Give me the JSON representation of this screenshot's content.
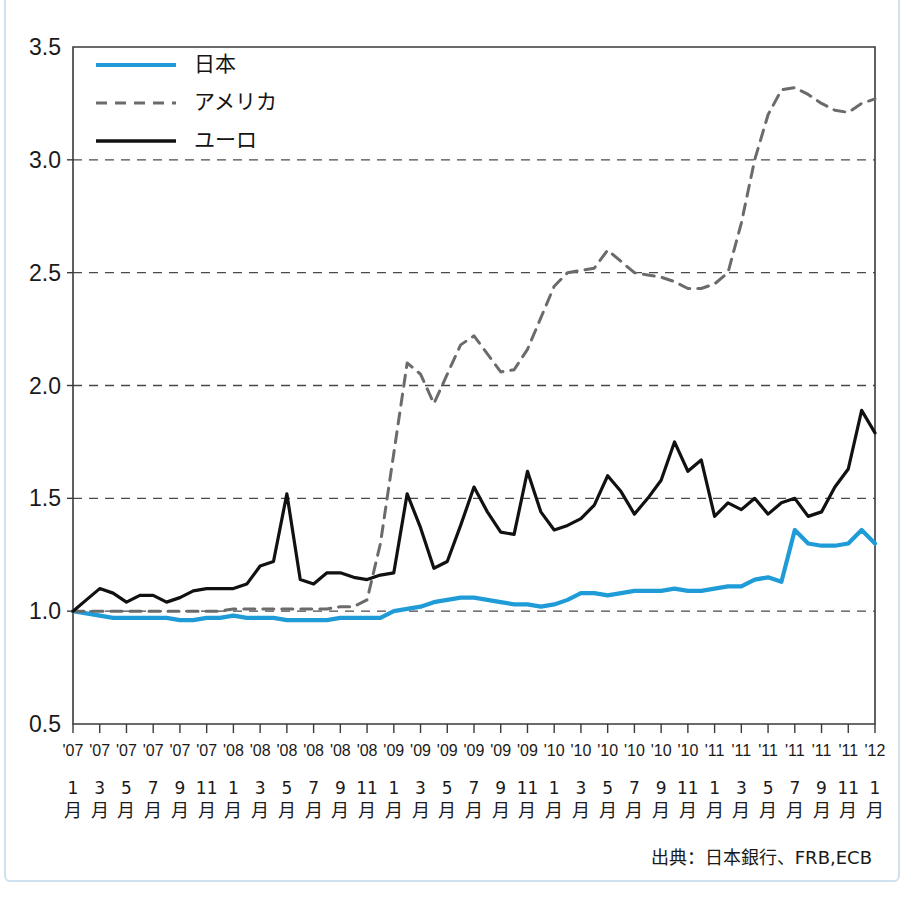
{
  "legend": {
    "position": "top-left-inside",
    "entries": [
      {
        "label": "日本",
        "style": "solid",
        "color": "#1f9cd8",
        "name": "japan"
      },
      {
        "label": "アメリカ",
        "style": "dashed",
        "color": "#6b6b6b",
        "name": "usa"
      },
      {
        "label": "ユーロ",
        "style": "solid",
        "color": "#111111",
        "name": "euro"
      }
    ]
  },
  "source": {
    "text": "出典：日本銀行、FRB,ECB"
  },
  "axis": {
    "y_ticks": [
      "3.5",
      "3.0",
      "2.5",
      "2.0",
      "1.5",
      "1.0",
      "0.5"
    ],
    "month_kanji": "月"
  },
  "chart_data": {
    "type": "line",
    "title": "",
    "xlabel": "",
    "ylabel": "",
    "ylim": [
      0.5,
      3.5
    ],
    "ytick_values": [
      0.5,
      1.0,
      1.5,
      2.0,
      2.5,
      3.0,
      3.5
    ],
    "grid": true,
    "legend_position": "top-left",
    "x_tick_labels": [
      {
        "year": "'07",
        "month": "1"
      },
      {
        "year": "'07",
        "month": "3"
      },
      {
        "year": "'07",
        "month": "5"
      },
      {
        "year": "'07",
        "month": "7"
      },
      {
        "year": "'07",
        "month": "9"
      },
      {
        "year": "'07",
        "month": "11"
      },
      {
        "year": "'08",
        "month": "1"
      },
      {
        "year": "'08",
        "month": "3"
      },
      {
        "year": "'08",
        "month": "5"
      },
      {
        "year": "'08",
        "month": "7"
      },
      {
        "year": "'08",
        "month": "9"
      },
      {
        "year": "'08",
        "month": "11"
      },
      {
        "year": "'09",
        "month": "1"
      },
      {
        "year": "'09",
        "month": "3"
      },
      {
        "year": "'09",
        "month": "5"
      },
      {
        "year": "'09",
        "month": "7"
      },
      {
        "year": "'09",
        "month": "9"
      },
      {
        "year": "'09",
        "month": "11"
      },
      {
        "year": "'10",
        "month": "1"
      },
      {
        "year": "'10",
        "month": "3"
      },
      {
        "year": "'10",
        "month": "5"
      },
      {
        "year": "'10",
        "month": "7"
      },
      {
        "year": "'10",
        "month": "9"
      },
      {
        "year": "'10",
        "month": "11"
      },
      {
        "year": "'11",
        "month": "1"
      },
      {
        "year": "'11",
        "month": "3"
      },
      {
        "year": "'11",
        "month": "5"
      },
      {
        "year": "'11",
        "month": "7"
      },
      {
        "year": "'11",
        "month": "9"
      },
      {
        "year": "'11",
        "month": "11"
      },
      {
        "year": "'12",
        "month": "1"
      }
    ],
    "x_index_range": [
      0,
      60
    ],
    "series": [
      {
        "name": "日本",
        "key": "japan",
        "color": "#1f9cd8",
        "style": "solid",
        "values": [
          1.0,
          0.99,
          0.98,
          0.97,
          0.97,
          0.97,
          0.97,
          0.97,
          0.96,
          0.96,
          0.97,
          0.97,
          0.98,
          0.97,
          0.97,
          0.97,
          0.96,
          0.96,
          0.96,
          0.96,
          0.97,
          0.97,
          0.97,
          0.97,
          1.0,
          1.01,
          1.02,
          1.04,
          1.05,
          1.06,
          1.06,
          1.05,
          1.04,
          1.03,
          1.03,
          1.02,
          1.03,
          1.05,
          1.08,
          1.08,
          1.07,
          1.08,
          1.09,
          1.09,
          1.09,
          1.1,
          1.09,
          1.09,
          1.1,
          1.11,
          1.11,
          1.14,
          1.15,
          1.13,
          1.36,
          1.3,
          1.29,
          1.29,
          1.3,
          1.36,
          1.3
        ]
      },
      {
        "name": "アメリカ",
        "key": "usa",
        "color": "#6b6b6b",
        "style": "dashed",
        "values": [
          1.0,
          1.0,
          1.0,
          1.0,
          1.0,
          1.0,
          1.0,
          1.0,
          1.0,
          1.0,
          1.0,
          1.0,
          1.01,
          1.01,
          1.01,
          1.01,
          1.01,
          1.01,
          1.01,
          1.01,
          1.02,
          1.02,
          1.05,
          1.3,
          1.7,
          2.1,
          2.05,
          1.92,
          2.05,
          2.18,
          2.22,
          2.14,
          2.06,
          2.07,
          2.16,
          2.3,
          2.44,
          2.5,
          2.51,
          2.52,
          2.6,
          2.55,
          2.5,
          2.49,
          2.48,
          2.46,
          2.43,
          2.43,
          2.45,
          2.5,
          2.72,
          3.0,
          3.2,
          3.31,
          3.32,
          3.29,
          3.25,
          3.22,
          3.21,
          3.25,
          3.27
        ]
      },
      {
        "name": "ユーロ",
        "key": "euro",
        "color": "#111111",
        "style": "solid",
        "values": [
          1.0,
          1.05,
          1.1,
          1.08,
          1.04,
          1.07,
          1.07,
          1.04,
          1.06,
          1.09,
          1.1,
          1.1,
          1.1,
          1.12,
          1.2,
          1.22,
          1.52,
          1.14,
          1.12,
          1.17,
          1.17,
          1.15,
          1.14,
          1.16,
          1.17,
          1.52,
          1.37,
          1.19,
          1.22,
          1.38,
          1.55,
          1.44,
          1.35,
          1.34,
          1.62,
          1.44,
          1.36,
          1.38,
          1.41,
          1.47,
          1.6,
          1.53,
          1.43,
          1.5,
          1.58,
          1.75,
          1.62,
          1.67,
          1.42,
          1.48,
          1.45,
          1.5,
          1.43,
          1.48,
          1.5,
          1.42,
          1.44,
          1.55,
          1.63,
          1.89,
          1.79
        ]
      }
    ]
  }
}
